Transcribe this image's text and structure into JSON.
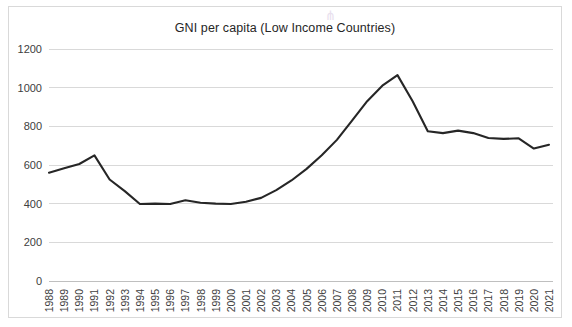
{
  "chart_data": {
    "type": "line",
    "title": "GNI per capita (Low Income Countries)",
    "xlabel": "",
    "ylabel": "",
    "ylim": [
      0,
      1200
    ],
    "ytick_step": 200,
    "yticks": [
      0,
      200,
      400,
      600,
      800,
      1000,
      1200
    ],
    "grid": true,
    "legend": false,
    "line_color": "#262626",
    "grid_color": "#d9d9d9",
    "categories": [
      "1988",
      "1989",
      "1990",
      "1991",
      "1992",
      "1993",
      "1994",
      "1995",
      "1996",
      "1997",
      "1998",
      "1999",
      "2000",
      "2001",
      "2002",
      "2003",
      "2004",
      "2005",
      "2006",
      "2007",
      "2008",
      "2009",
      "2010",
      "2011",
      "2012",
      "2013",
      "2014",
      "2015",
      "2016",
      "2017",
      "2018",
      "2019",
      "2020",
      "2021"
    ],
    "values": [
      560,
      583,
      605,
      650,
      525,
      465,
      398,
      400,
      398,
      418,
      405,
      400,
      398,
      410,
      430,
      470,
      520,
      580,
      650,
      730,
      830,
      930,
      1010,
      1065,
      930,
      775,
      765,
      778,
      765,
      740,
      735,
      738,
      685,
      705
    ]
  },
  "annotations": {
    "corner_glyph": "⋔"
  }
}
